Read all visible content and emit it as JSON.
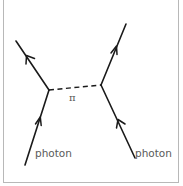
{
  "diagram": {
    "type": "feynman-diagram",
    "exchange_label": "π",
    "labels": {
      "left_incoming": "photon",
      "right_incoming": "photon"
    },
    "vertices": [
      {
        "id": "v1",
        "x": 49,
        "y": 90
      },
      {
        "id": "v2",
        "x": 101,
        "y": 85
      }
    ],
    "edges": [
      {
        "id": "left-incoming",
        "from": [
          25,
          165
        ],
        "to": [
          49,
          90
        ],
        "style": "solid",
        "arrow": "toward-vertex",
        "label": "photon"
      },
      {
        "id": "left-outgoing",
        "from": [
          49,
          90
        ],
        "to": [
          16,
          41
        ],
        "style": "solid",
        "arrow": "away-from-vertex"
      },
      {
        "id": "exchange",
        "from": [
          49,
          90
        ],
        "to": [
          101,
          85
        ],
        "style": "dashed",
        "label": "π"
      },
      {
        "id": "right-incoming",
        "from": [
          135,
          158
        ],
        "to": [
          101,
          85
        ],
        "style": "solid",
        "arrow": "toward-vertex",
        "label": "photon"
      },
      {
        "id": "right-outgoing",
        "from": [
          101,
          85
        ],
        "to": [
          126,
          24
        ],
        "style": "solid",
        "arrow": "away-from-vertex"
      }
    ],
    "colors": {
      "line": "#1a1a1a",
      "label": "#5a5a5a",
      "frame": "#b8b8b8",
      "background": "#ffffff"
    }
  }
}
